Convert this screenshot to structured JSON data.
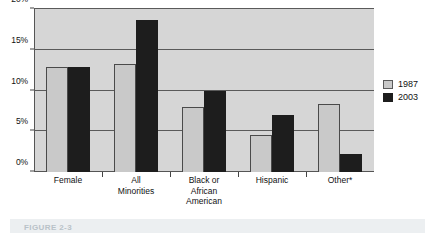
{
  "chart_data": {
    "type": "bar",
    "title": "",
    "xlabel": "",
    "ylabel": "",
    "ylim": [
      0,
      20
    ],
    "yticks": [
      "0%",
      "5%",
      "10%",
      "15%",
      "20%"
    ],
    "ytick_values": [
      0,
      5,
      10,
      15,
      20
    ],
    "grid": true,
    "legend_position": "right",
    "categories": [
      "Female",
      "All Minorities",
      "Black or African American",
      "Hispanic",
      "Other*"
    ],
    "category_lines": [
      [
        "Female"
      ],
      [
        "All",
        "Minorities"
      ],
      [
        "Black or",
        "African",
        "American"
      ],
      [
        "Hispanic"
      ],
      [
        "Other*"
      ]
    ],
    "series": [
      {
        "name": "1987",
        "color": "#c9c9c9",
        "values": [
          12.9,
          13.3,
          8.0,
          4.6,
          8.4
        ]
      },
      {
        "name": "2003",
        "color": "#1d1d1d",
        "values": [
          12.9,
          18.7,
          9.9,
          7.0,
          2.2
        ]
      }
    ]
  },
  "legend": {
    "items": [
      {
        "label": "1987",
        "key": "y1987"
      },
      {
        "label": "2003",
        "key": "y2003"
      }
    ]
  },
  "caption": {
    "text": "FIGURE 2-3"
  }
}
